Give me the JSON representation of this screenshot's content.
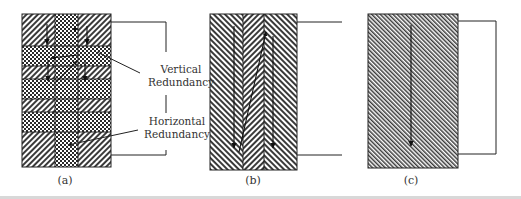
{
  "figure": {
    "panels": [
      {
        "id": "a",
        "caption": "(a)",
        "description": "Block with three columns; rows alternate diagonal hatching and checkerboard. Arrows show zig-zag traversal order.",
        "annotations": [
          {
            "label_line1": "Vertical",
            "label_line2": "Redundancy"
          },
          {
            "label_line1": "Horizontal",
            "label_line2": "Redundancy"
          }
        ]
      },
      {
        "id": "b",
        "caption": "(b)",
        "description": "Block with three vertical strips of alternating diagonal hatching; two long downward arrows and one diagonal return arrow."
      },
      {
        "id": "c",
        "caption": "(c)",
        "description": "Single uniformly hatched block with one long downward arrow."
      }
    ],
    "colors": {
      "stroke": "#222222",
      "hatch": "#333333",
      "background": "#ffffff",
      "caption_text": "#333333"
    }
  }
}
